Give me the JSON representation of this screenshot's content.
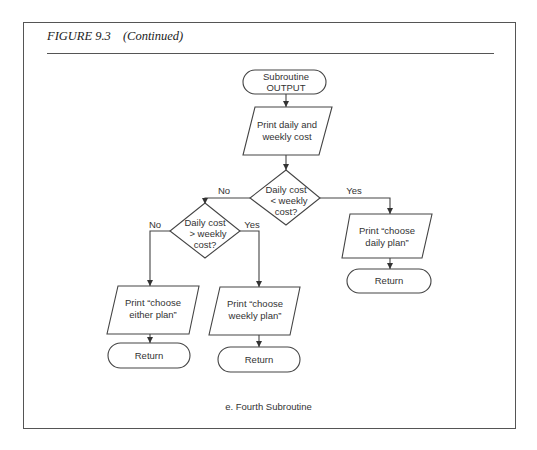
{
  "figure": {
    "label": "FIGURE 9.3",
    "continued": "(Continued)",
    "caption": "e.  Fourth Subroutine"
  },
  "flowchart": {
    "start": {
      "line1": "Subroutine",
      "line2": "OUTPUT"
    },
    "print_costs": {
      "line1": "Print daily and",
      "line2": "weekly cost"
    },
    "decision_less": {
      "line1": "Daily cost",
      "line2": "< weekly",
      "line3": "cost?",
      "no_label": "No",
      "yes_label": "Yes"
    },
    "decision_greater": {
      "line1": "Daily cost",
      "line2": "> weekly",
      "line3": "cost?",
      "no_label": "No",
      "yes_label": "Yes"
    },
    "print_daily": {
      "line1": "Print “choose",
      "line2": "daily plan”"
    },
    "print_either": {
      "line1": "Print “choose",
      "line2": "either plan”"
    },
    "print_weekly": {
      "line1": "Print “choose",
      "line2": "weekly plan”"
    },
    "return_daily": {
      "label": "Return"
    },
    "return_either": {
      "label": "Return"
    },
    "return_weekly": {
      "label": "Return"
    }
  },
  "colors": {
    "line": "#444444",
    "text": "#333333",
    "background": "#ffffff"
  }
}
